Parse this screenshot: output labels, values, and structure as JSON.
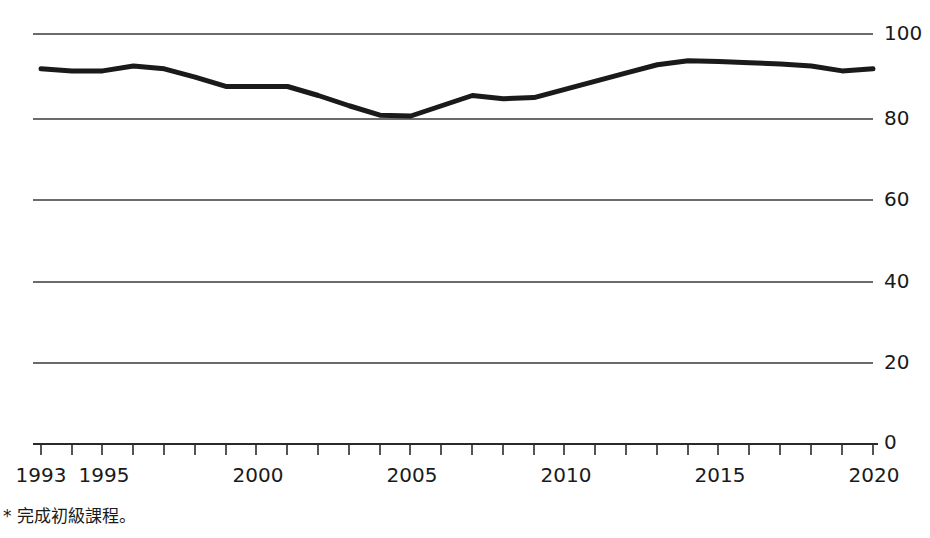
{
  "chart_data": {
    "type": "line",
    "title": "",
    "subtitle": "",
    "xlabel": "",
    "ylabel": "",
    "xlim": [
      1993,
      2020
    ],
    "ylim": [
      0,
      100
    ],
    "grid": true,
    "legend": null,
    "y_ticks": [
      100,
      80,
      60,
      40,
      20,
      0
    ],
    "y_tick_labels": [
      "100",
      "80",
      "60",
      "40",
      "20",
      "0"
    ],
    "x_ticks": [
      1993,
      1994,
      1995,
      1996,
      1997,
      1998,
      1999,
      2000,
      2001,
      2002,
      2003,
      2004,
      2005,
      2006,
      2007,
      2008,
      2009,
      2010,
      2011,
      2012,
      2013,
      2014,
      2015,
      2016,
      2017,
      2018,
      2019,
      2020
    ],
    "x_tick_labels_shown": [
      "1993",
      "1995",
      "2000",
      "2005",
      "2010",
      "2015",
      "2020"
    ],
    "x": [
      1993,
      1994,
      1995,
      1996,
      1997,
      1998,
      1999,
      2000,
      2001,
      2002,
      2003,
      2004,
      2005,
      2006,
      2007,
      2008,
      2009,
      2010,
      2011,
      2012,
      2013,
      2014,
      2015,
      2016,
      2017,
      2018,
      2019,
      2020
    ],
    "values": [
      91.5,
      91,
      91,
      92.2,
      91.5,
      89.5,
      87.2,
      87.2,
      87.2,
      85,
      82.5,
      80.2,
      80,
      82.5,
      85,
      84.2,
      84.5,
      86.5,
      88.5,
      90.5,
      92.5,
      93.5,
      93.3,
      93,
      92.7,
      92.2,
      91,
      91.5
    ],
    "series": [
      {
        "name": "",
        "color": "#1a1a1a",
        "line_width": 5,
        "values": [
          91.5,
          91,
          91,
          92.2,
          91.5,
          89.5,
          87.2,
          87.2,
          87.2,
          85,
          82.5,
          80.2,
          80,
          82.5,
          85,
          84.2,
          84.5,
          86.5,
          88.5,
          90.5,
          92.5,
          93.5,
          93.3,
          93,
          92.7,
          92.2,
          91,
          91.5
        ]
      }
    ],
    "annotations": []
  },
  "axis": {
    "y_labels": [
      "100",
      "80",
      "60",
      "40",
      "20",
      "0"
    ],
    "x_labels": [
      "1993",
      "1995",
      "2000",
      "2005",
      "2010",
      "2015",
      "2020"
    ]
  },
  "footnote": {
    "text": "* 完成初級課程。"
  },
  "colors": {
    "line": "#1a1a1a",
    "grid": "#3a3a3a",
    "axis": "#2a2a2a",
    "text": "#1a1a1a",
    "background": "#ffffff"
  }
}
